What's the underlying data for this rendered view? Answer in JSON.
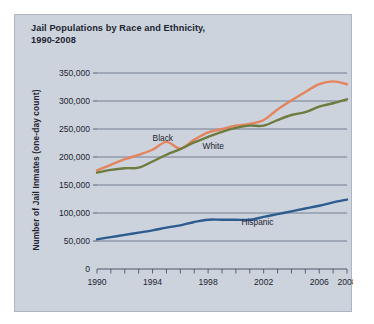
{
  "chart_data": {
    "type": "line",
    "title": "Jail Populations by Race and Ethnicity, 1990-2008",
    "title_line1": "Jail Populations by Race and Ethnicity,",
    "title_line2": "1990-2008",
    "xlabel": "",
    "ylabel": "Number of Jail Inmates (one-day count)",
    "ylim": [
      0,
      350000
    ],
    "xlim": [
      1990,
      2008
    ],
    "grid": true,
    "legend_position": "inline-labels",
    "ytick_values": [
      0,
      50000,
      100000,
      150000,
      200000,
      250000,
      300000,
      350000
    ],
    "ytick_labels": [
      "0",
      "50,000",
      "100,000",
      "150,000",
      "200,000",
      "250,000",
      "300,000",
      "350,000"
    ],
    "xtick_values": [
      1990,
      1991,
      1992,
      1993,
      1994,
      1995,
      1996,
      1997,
      1998,
      1999,
      2000,
      2001,
      2002,
      2003,
      2004,
      2005,
      2006,
      2007,
      2008
    ],
    "xtick_labels_shown": [
      "1990",
      "1994",
      "1998",
      "2002",
      "2006",
      "2008"
    ],
    "xtick_labeled_values": [
      1990,
      1994,
      1998,
      2002,
      2006,
      2008
    ],
    "x": [
      1990,
      1991,
      1992,
      1993,
      1994,
      1995,
      1996,
      1997,
      1998,
      1999,
      2000,
      2001,
      2002,
      2003,
      2004,
      2005,
      2006,
      2007,
      2008
    ],
    "series": [
      {
        "name": "Black",
        "color": "#e3845c",
        "label_text": "Black",
        "values": [
          176000,
          186000,
          196000,
          204000,
          213000,
          227000,
          215000,
          231000,
          244000,
          250000,
          256000,
          259000,
          266000,
          285000,
          301000,
          316000,
          330000,
          335000,
          330000
        ]
      },
      {
        "name": "White",
        "color": "#6d7b3c",
        "label_text": "White",
        "values": [
          172000,
          177000,
          180000,
          181000,
          192000,
          204000,
          214000,
          226000,
          236000,
          245000,
          252000,
          256000,
          256000,
          266000,
          275000,
          280000,
          290000,
          296000,
          303000
        ]
      },
      {
        "name": "Hispanic",
        "color": "#2d5c90",
        "label_text": "Hispanic",
        "values": [
          53000,
          57000,
          61000,
          65000,
          69000,
          74000,
          78000,
          84000,
          88000,
          88000,
          88000,
          88000,
          93000,
          98000,
          103000,
          108000,
          113000,
          119000,
          124000
        ]
      }
    ],
    "annotations": [
      {
        "text": "Black",
        "x": 1994.0,
        "y": 228000,
        "anchor": "series-black"
      },
      {
        "text": "White",
        "x": 1997.6,
        "y": 214000,
        "anchor": "series-white"
      },
      {
        "text": "Hispanic",
        "x": 2000.4,
        "y": 78000,
        "anchor": "series-hispanic"
      }
    ]
  }
}
